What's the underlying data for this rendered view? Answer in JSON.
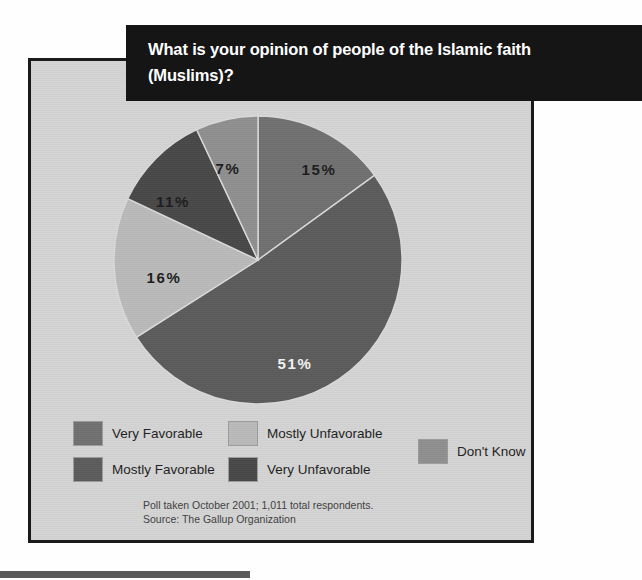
{
  "title": {
    "line1": "What is your opinion of people of the Islamic faith",
    "line2": "(Muslims)?"
  },
  "colors": {
    "very_favorable": "#6f6f6f",
    "mostly_favorable": "#5a5a5a",
    "mostly_unfavorable": "#b9b9b9",
    "very_unfavorable": "#474747",
    "dont_know": "#8e8e8e",
    "panel_background": "#d3d3d3",
    "banner_background": "#151515",
    "banner_text": "#ffffff",
    "label_dark": "#1b1b1b",
    "label_light": "#f2f2f2",
    "bottom_bar": "#5a5a5a"
  },
  "chart_data": {
    "type": "pie",
    "title": "What is your opinion of people of the Islamic faith (Muslims)?",
    "xlabel": "",
    "ylabel": "",
    "legend_position": "bottom",
    "grid": false,
    "unit": "%",
    "start_angle_deg": 0,
    "direction": "clockwise",
    "categories": [
      "Very Favorable",
      "Very Unfavorable",
      "Mostly Unfavorable",
      "Mostly Favorable",
      "Don't Know"
    ],
    "values": [
      15,
      51,
      16,
      11,
      7
    ],
    "slices": [
      {
        "label": "Very Favorable",
        "value": 15,
        "value_label": "15%",
        "color": "#6f6f6f",
        "label_color": "label_dark",
        "start_deg": 0,
        "end_deg": 54,
        "label_x": 206,
        "label_y": 58
      },
      {
        "label": "Very Unfavorable",
        "value": 51,
        "value_label": "51%",
        "color": "#5a5a5a",
        "label_color": "label_light",
        "start_deg": 54,
        "end_deg": 237.6,
        "label_x": 182,
        "label_y": 252
      },
      {
        "label": "Mostly Unfavorable",
        "value": 16,
        "value_label": "16%",
        "color": "#b9b9b9",
        "label_color": "label_dark",
        "start_deg": 237.6,
        "end_deg": 295.2,
        "label_x": 51,
        "label_y": 166
      },
      {
        "label": "Mostly Favorable",
        "value": 11,
        "value_label": "11%",
        "color": "#474747",
        "label_color": "label_dark",
        "start_deg": 295.2,
        "end_deg": 334.8,
        "label_x": 60,
        "label_y": 90
      },
      {
        "label": "Don't Know",
        "value": 7,
        "value_label": "7%",
        "color": "#8e8e8e",
        "label_color": "label_dark",
        "start_deg": 334.8,
        "end_deg": 360,
        "label_x": 115,
        "label_y": 57
      }
    ]
  },
  "legend": {
    "items": [
      {
        "label": "Very Favorable",
        "color": "#6f6f6f"
      },
      {
        "label": "Mostly Favorable",
        "color": "#5a5a5a"
      },
      {
        "label": "Mostly Unfavorable",
        "color": "#b9b9b9"
      },
      {
        "label": "Very Unfavorable",
        "color": "#474747"
      },
      {
        "label": "Don't Know",
        "color": "#8e8e8e"
      }
    ]
  },
  "footnote": {
    "line1": "Poll taken October 2001; 1,011 total respondents.",
    "line2": "Source: The Gallup Organization"
  }
}
